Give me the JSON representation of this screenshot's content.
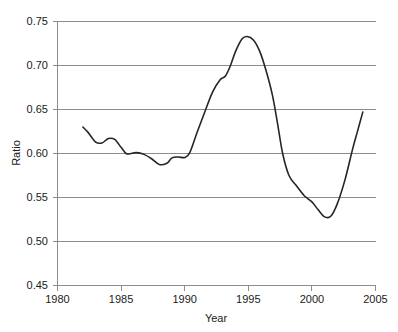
{
  "chart_data": {
    "type": "line",
    "title": "",
    "xlabel": "Year",
    "ylabel": "Ratio",
    "xlim": [
      1980,
      2005
    ],
    "ylim": [
      0.45,
      0.75
    ],
    "grid": true,
    "legend": false,
    "legend_position": "none",
    "xticks": [
      1980,
      1985,
      1990,
      1995,
      2000,
      2005
    ],
    "xtick_labels": [
      "1980",
      "1985",
      "1990",
      "1995",
      "2000",
      "2005"
    ],
    "yticks": [
      0.45,
      0.5,
      0.55,
      0.6,
      0.65,
      0.7,
      0.75
    ],
    "ytick_labels": [
      "0.45",
      "0.50",
      "0.55",
      "0.60",
      "0.65",
      "0.70",
      "0.75"
    ],
    "line_color": "#262626",
    "grid_color": "#8c8c8c",
    "series": [
      {
        "name": "Ratio",
        "x": [
          1982.0,
          1982.4,
          1983.0,
          1983.5,
          1984.0,
          1984.5,
          1985.0,
          1985.4,
          1985.8,
          1986.2,
          1986.8,
          1987.4,
          1988.0,
          1988.6,
          1989.0,
          1989.5,
          1990.0,
          1990.4,
          1991.0,
          1991.6,
          1992.2,
          1992.8,
          1993.2,
          1993.6,
          1994.0,
          1994.5,
          1994.9,
          1995.4,
          1995.9,
          1996.4,
          1996.9,
          1997.3,
          1997.7,
          1998.2,
          1998.8,
          1999.4,
          2000.0,
          2000.5,
          2001.0,
          2001.5,
          2002.0,
          2002.6,
          2003.2,
          2003.6,
          2004.0
        ],
        "y": [
          0.63,
          0.624,
          0.613,
          0.612,
          0.617,
          0.616,
          0.607,
          0.6,
          0.6,
          0.601,
          0.599,
          0.594,
          0.5875,
          0.589,
          0.595,
          0.596,
          0.5955,
          0.601,
          0.625,
          0.648,
          0.67,
          0.684,
          0.688,
          0.7,
          0.716,
          0.73,
          0.733,
          0.729,
          0.716,
          0.694,
          0.666,
          0.634,
          0.6,
          0.575,
          0.563,
          0.552,
          0.545,
          0.536,
          0.528,
          0.529,
          0.543,
          0.57,
          0.605,
          0.626,
          0.647
        ]
      }
    ]
  },
  "axes": {
    "y_title": "Ratio",
    "x_title": "Year"
  }
}
